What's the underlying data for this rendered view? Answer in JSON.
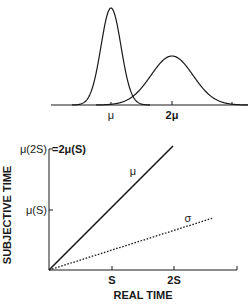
{
  "top_panel": {
    "curves": [
      {
        "name": "narrow-gaussian",
        "mean_label": "μ",
        "peak_x": 111,
        "peak_y": 8,
        "sd_px": 10
      },
      {
        "name": "wide-gaussian",
        "mean_label": "2μ",
        "peak_x": 172,
        "peak_y": 56,
        "sd_px": 21
      }
    ],
    "tick_labels": [
      "μ",
      "2μ"
    ]
  },
  "bottom_panel": {
    "y_axis_label": "SUBJECTIVE TIME",
    "x_axis_label": "REAL TIME",
    "y_tick_labels": {
      "top": "μ(2S)",
      "top_eq": "=2μ(S)",
      "mid": "μ(S)"
    },
    "x_tick_labels": [
      "S",
      "2S"
    ],
    "line_labels": {
      "mean": "μ",
      "sd": "σ"
    }
  },
  "chart_data": [
    {
      "type": "line",
      "title": "",
      "description": "Two Gaussian distributions of subjective time; the one centered at 2μ is wider (scalar variance)",
      "x_tick_labels": [
        "μ",
        "2μ"
      ],
      "series": [
        {
          "name": "distribution at μ",
          "mean": 1,
          "sd": 0.17,
          "peak_relative": 1.0
        },
        {
          "name": "distribution at 2μ",
          "mean": 2,
          "sd": 0.34,
          "peak_relative": 0.5
        }
      ],
      "grid": false
    },
    {
      "type": "line",
      "title": "",
      "xlabel": "REAL TIME",
      "ylabel": "SUBJECTIVE TIME",
      "x_tick_labels": [
        "S",
        "2S"
      ],
      "y_tick_labels": [
        "μ(S)",
        "μ(2S) =2μ(S)"
      ],
      "series": [
        {
          "name": "μ",
          "style": "solid",
          "x": [
            0,
            1,
            2
          ],
          "y": [
            0,
            1,
            2
          ]
        },
        {
          "name": "σ",
          "style": "dotted",
          "x": [
            0,
            2.6
          ],
          "y": [
            0,
            0.7
          ]
        }
      ],
      "xlim": [
        0,
        3
      ],
      "ylim": [
        0,
        2
      ],
      "grid": false
    }
  ]
}
